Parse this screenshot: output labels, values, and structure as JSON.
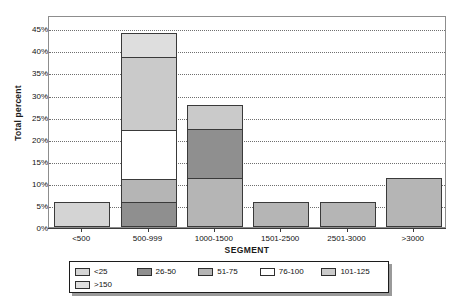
{
  "chart_data": {
    "type": "bar",
    "stacked": true,
    "title": "",
    "xlabel": "SEGMENT",
    "ylabel": "Total percent",
    "categories": [
      "<500",
      "500-999",
      "1000-1500",
      "1501-2500",
      "2501-3000",
      ">3000"
    ],
    "ylim": [
      0,
      48
    ],
    "ytick_values": [
      0,
      5,
      10,
      15,
      20,
      25,
      30,
      35,
      40,
      45
    ],
    "ytick_labels": [
      "0%",
      "5%",
      "10%",
      "15%",
      "20%",
      "25%",
      "30%",
      "35%",
      "40%",
      "45%"
    ],
    "grid": "horizontal-dotted",
    "legend_position": "below-plot",
    "series": [
      {
        "name": "<25",
        "color": "#d4d4d4",
        "values": [
          5.6,
          0,
          0,
          0,
          0,
          0
        ]
      },
      {
        "name": "26-50",
        "color": "#8f8f8f",
        "values": [
          0,
          5.6,
          11.2,
          0,
          0,
          0
        ]
      },
      {
        "name": "51-75",
        "color": "#b5b5b5",
        "values": [
          0,
          5.6,
          11.2,
          5.6,
          5.6,
          11.2
        ]
      },
      {
        "name": "76-100",
        "color": "#ffffff",
        "values": [
          0,
          11.2,
          0,
          0,
          0,
          0
        ]
      },
      {
        "name": "101-125",
        "color": "#cacaca",
        "values": [
          0,
          16.8,
          5.6,
          0,
          0,
          0
        ]
      },
      {
        "name": ">150",
        "color": "#dedede",
        "values": [
          0,
          5.6,
          0,
          0,
          0,
          0
        ]
      }
    ],
    "bar_totals": [
      5.6,
      44.8,
      28.0,
      5.6,
      5.6,
      11.2
    ],
    "stack_order_per_bar": [
      [
        "<25"
      ],
      [
        "26-50",
        "51-75",
        "76-100",
        "101-125",
        ">150"
      ],
      [
        "51-75",
        "26-50",
        "101-125"
      ],
      [
        "51-75"
      ],
      [
        "51-75"
      ],
      [
        "51-75"
      ]
    ]
  },
  "legend": {
    "entries": [
      {
        "label": "<25",
        "color": "#d4d4d4"
      },
      {
        "label": "26-50",
        "color": "#8f8f8f"
      },
      {
        "label": "51-75",
        "color": "#b5b5b5"
      },
      {
        "label": "76-100",
        "color": "#ffffff"
      },
      {
        "label": "101-125",
        "color": "#cacaca"
      },
      {
        "label": ">150",
        "color": "#dedede"
      }
    ]
  }
}
